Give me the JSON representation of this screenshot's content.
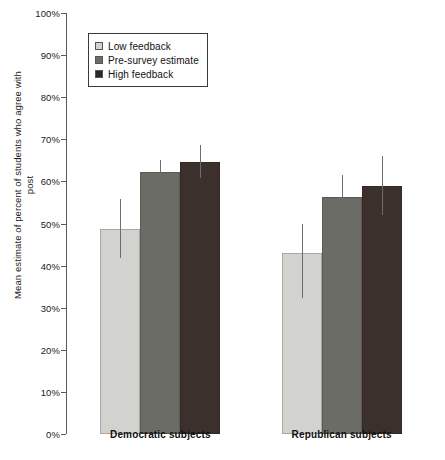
{
  "chart_data": {
    "type": "bar",
    "title": "",
    "xlabel": "",
    "ylabel": "Mean estimate of percent of students who agree with post",
    "ylim": [
      0,
      100
    ],
    "ytick_labels": [
      "100%",
      "90%",
      "80%",
      "70%",
      "60%",
      "50%",
      "40%",
      "30%",
      "20%",
      "10%",
      "0%"
    ],
    "ytick_values": [
      100,
      90,
      80,
      70,
      60,
      50,
      40,
      30,
      20,
      10,
      0
    ],
    "grid": false,
    "legend_position": "top-left",
    "categories": [
      "Democratic subjects",
      "Republican subjects"
    ],
    "series": [
      {
        "name": "Low feedback",
        "color": "#d2d2ce",
        "values": [
          48.7,
          43.0
        ],
        "error_low": [
          41.8,
          32.2
        ],
        "error_high": [
          55.8,
          50.0
        ]
      },
      {
        "name": "Pre-survey estimate",
        "color": "#6c6c66",
        "values": [
          62.2,
          56.3
        ],
        "error_low": [
          59.2,
          51.0
        ],
        "error_high": [
          65.2,
          61.5
        ]
      },
      {
        "name": "High feedback",
        "color": "#3b302c",
        "values": [
          64.6,
          58.9
        ],
        "error_low": [
          60.8,
          52.0
        ],
        "error_high": [
          68.6,
          66.0
        ]
      }
    ]
  },
  "legend": {
    "items": [
      {
        "label": "Low feedback",
        "swatch": "low"
      },
      {
        "label": "Pre-survey estimate",
        "swatch": "pre"
      },
      {
        "label": "High feedback",
        "swatch": "high"
      }
    ]
  },
  "axes": {
    "y_axis_label": "Mean estimate of percent of students who agree with post"
  }
}
